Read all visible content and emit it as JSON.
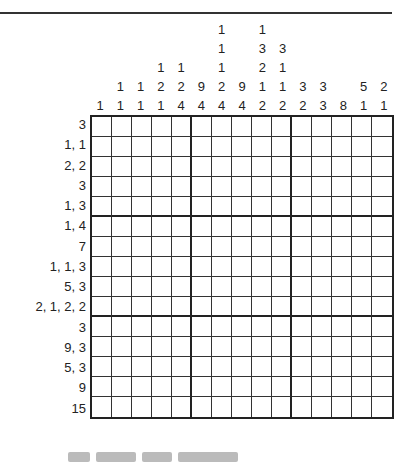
{
  "puzzle": {
    "type": "nonogram",
    "size": [
      15,
      15
    ],
    "column_clues": [
      [
        "1"
      ],
      [
        "1",
        "1"
      ],
      [
        "1",
        "1"
      ],
      [
        "1",
        "2",
        "1"
      ],
      [
        "1",
        "2",
        "4"
      ],
      [
        "9",
        "4"
      ],
      [
        "1",
        "1",
        "1",
        "2",
        "4"
      ],
      [
        "9",
        "4"
      ],
      [
        "1",
        "3",
        "2",
        "1",
        "2"
      ],
      [
        "3",
        "1",
        "1",
        "2"
      ],
      [
        "3",
        "2"
      ],
      [
        "3",
        "3"
      ],
      [
        "8"
      ],
      [
        "5",
        "1"
      ],
      [
        "2",
        "1"
      ]
    ],
    "row_clues": [
      "3",
      "1, 1",
      "2, 2",
      "3",
      "1, 3",
      "1, 4",
      "7",
      "1, 1, 3",
      "5, 3",
      "2, 1, 2, 2",
      "3",
      "9, 3",
      "5, 3",
      "9",
      "15"
    ],
    "colors": {
      "grid": "#222222",
      "background": "#ffffff",
      "text": "#222222"
    }
  }
}
